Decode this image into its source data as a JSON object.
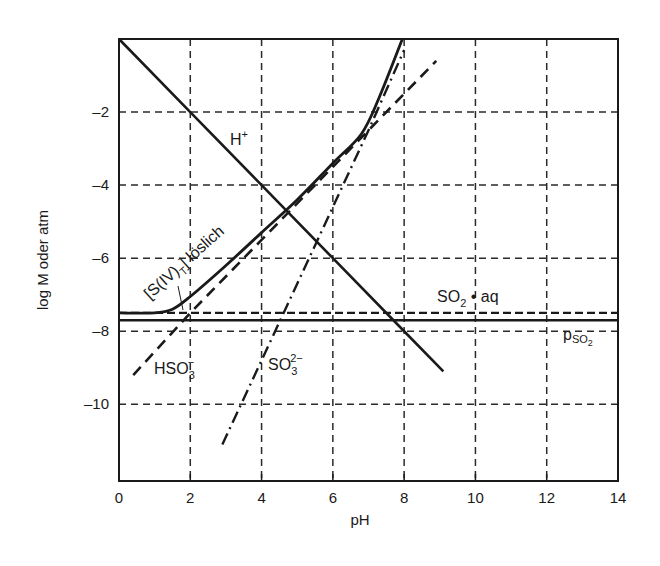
{
  "chart_data": {
    "type": "line",
    "title": "",
    "xlabel": "pH",
    "ylabel": "log M oder atm",
    "xlim": [
      0,
      14
    ],
    "ylim": [
      -12.1,
      0
    ],
    "x_ticks": [
      "0",
      "2",
      "4",
      "6",
      "8",
      "10",
      "12",
      "14"
    ],
    "y_ticks": [
      "-2",
      "-4",
      "-6",
      "-8",
      "-10"
    ],
    "grid": "dashed, every 2 units",
    "legend": "none (inline annotations)",
    "series": [
      {
        "name": "H+",
        "style": "solid",
        "x": [
          0,
          2,
          4,
          6,
          8,
          9.1
        ],
        "y": [
          0,
          -2,
          -4,
          -6,
          -8,
          -9.1
        ]
      },
      {
        "name": "[S(IV)_T] löslich",
        "style": "solid-thick",
        "x": [
          0,
          1.0,
          1.5,
          2.0,
          3.0,
          4.0,
          5.0,
          6.0,
          6.8,
          7.3,
          7.95
        ],
        "y": [
          -7.5,
          -7.5,
          -7.4,
          -7.05,
          -6.2,
          -5.3,
          -4.4,
          -3.4,
          -2.6,
          -1.6,
          0
        ]
      },
      {
        "name": "HSO3-",
        "style": "dashed",
        "x": [
          0.4,
          2,
          4,
          6,
          8,
          8.9
        ],
        "y": [
          -9.2,
          -7.5,
          -5.5,
          -3.5,
          -1.5,
          -0.6
        ]
      },
      {
        "name": "SO3 2-",
        "style": "dash-dot",
        "x": [
          2.9,
          4,
          5,
          6,
          7,
          8.0
        ],
        "y": [
          -11.1,
          -8.8,
          -6.7,
          -4.6,
          -2.5,
          -0.3
        ]
      },
      {
        "name": "SO2·aq",
        "style": "dashed-horizontal",
        "x": [
          0,
          14
        ],
        "y": [
          -7.5,
          -7.5
        ]
      },
      {
        "name": "pSO2",
        "style": "solid-horizontal",
        "x": [
          0,
          14
        ],
        "y": [
          -7.7,
          -7.7
        ]
      }
    ],
    "annotations": [
      {
        "text": "H⁺",
        "x": 5.1,
        "y": -2.8
      },
      {
        "text": "[S(IV)T] löslich",
        "x": 1.5,
        "y": -6.5,
        "rotation": -40
      },
      {
        "text": "SO2 • aq",
        "x": 10.0,
        "y": -7.1
      },
      {
        "text": "pSO2",
        "x": 12.9,
        "y": -8.1
      },
      {
        "text": "HSO3⁻",
        "x": 1.3,
        "y": -9.1
      },
      {
        "text": "SO3²⁻",
        "x": 4.2,
        "y": -9.1
      }
    ]
  },
  "labels": {
    "xlabel": "pH",
    "ylabel": "log M oder atm",
    "h_plus": "H",
    "h_plus_sup": "+",
    "siv_main": "[S(IV)",
    "siv_sub": "T",
    "siv_close": "] löslich",
    "so2aq_main": "SO",
    "so2aq_sub": "2",
    "so2aq_rest": " • aq",
    "pso2_main": "p",
    "pso2_sub": "SO",
    "pso2_subsub": "2",
    "hso3_main": "HSO",
    "hso3_sub": "3",
    "hso3_sup": "−",
    "so3_main": "SO",
    "so3_sub": "3",
    "so3_sup": "2−"
  },
  "colors": {
    "ink": "#1a1a1a",
    "grid": "#2a2a2a",
    "background": "#ffffff"
  }
}
